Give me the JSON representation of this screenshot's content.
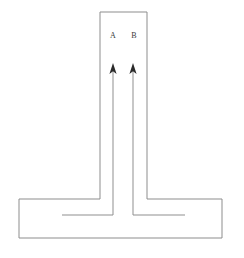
{
  "figure": {
    "type": "line-diagram",
    "background_color": "#ffffff",
    "line_color": "#8d8d8d",
    "arrow_color": "#2b2b2b",
    "label_color": "#3a3a3a",
    "width": 244,
    "height": 258
  },
  "labels": {
    "channel_a": "A",
    "channel_b": "B"
  },
  "geometry": {
    "column": {
      "left_wall_x": 100,
      "right_wall_x": 147,
      "top_y": 12,
      "bottom_y": 199
    },
    "base": {
      "left_x": 19,
      "right_x": 222,
      "top_y": 199,
      "bottom_y": 238
    },
    "arrow_a": {
      "tip_x": 113,
      "tip_y": 64,
      "stem_bottom_y": 215,
      "elbow_end_x": 62
    },
    "arrow_b": {
      "tip_x": 133,
      "tip_y": 64,
      "stem_bottom_y": 215,
      "elbow_end_x": 185
    },
    "label_a_pos": {
      "x": 113,
      "y": 36
    },
    "label_b_pos": {
      "x": 134,
      "y": 36
    }
  }
}
